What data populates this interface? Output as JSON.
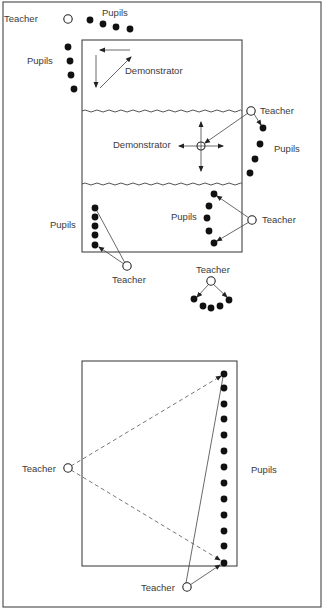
{
  "diagram1": {
    "box": {
      "x": 82,
      "y": 40,
      "w": 160,
      "h": 212
    },
    "dividers": [
      110,
      184
    ],
    "labels": [
      {
        "id": "teacher-topleft",
        "text": "Teacher",
        "x": 4,
        "y": 22
      },
      {
        "id": "pupils-top",
        "text": "Pupils",
        "x": 102,
        "y": 16
      },
      {
        "id": "pupils-left",
        "text": "Pupils",
        "x": 27,
        "y": 64
      },
      {
        "id": "demonstrator-top",
        "text": "Demonstrator",
        "x": 125,
        "y": 74
      },
      {
        "id": "teacher-mid-right",
        "text": "Teacher",
        "x": 260,
        "y": 114
      },
      {
        "id": "pupils-mid-right",
        "text": "Pupils",
        "x": 274,
        "y": 152
      },
      {
        "id": "demonstrator-mid",
        "text": "Demonstrator",
        "x": 113,
        "y": 148
      },
      {
        "id": "pupils-lower-left",
        "text": "Pupils",
        "x": 50,
        "y": 228
      },
      {
        "id": "pupils-lower-mid",
        "text": "Pupils",
        "x": 171,
        "y": 220
      },
      {
        "id": "teacher-lower-right",
        "text": "Teacher",
        "x": 262,
        "y": 223
      },
      {
        "id": "teacher-lower-left",
        "text": "Teacher",
        "x": 112,
        "y": 283
      },
      {
        "id": "teacher-bottom-group",
        "text": "Teacher",
        "x": 196,
        "y": 273
      }
    ],
    "teachers": [
      {
        "id": "t1",
        "x": 68,
        "y": 19
      },
      {
        "id": "t2",
        "x": 251,
        "y": 111
      },
      {
        "id": "t3",
        "x": 252,
        "y": 220
      },
      {
        "id": "t4",
        "x": 127,
        "y": 266
      },
      {
        "id": "t5",
        "x": 211,
        "y": 281
      }
    ],
    "pupils": [
      {
        "x": 90,
        "y": 20
      },
      {
        "x": 103,
        "y": 24
      },
      {
        "x": 116,
        "y": 27
      },
      {
        "x": 130,
        "y": 29
      },
      {
        "x": 68,
        "y": 47
      },
      {
        "x": 70,
        "y": 61
      },
      {
        "x": 71,
        "y": 75
      },
      {
        "x": 74,
        "y": 89
      },
      {
        "x": 263,
        "y": 128
      },
      {
        "x": 260,
        "y": 144
      },
      {
        "x": 255,
        "y": 159
      },
      {
        "x": 250,
        "y": 173
      },
      {
        "x": 95,
        "y": 208
      },
      {
        "x": 95,
        "y": 217
      },
      {
        "x": 95,
        "y": 226
      },
      {
        "x": 95,
        "y": 235
      },
      {
        "x": 95,
        "y": 245
      },
      {
        "x": 214,
        "y": 194
      },
      {
        "x": 209,
        "y": 206
      },
      {
        "x": 207,
        "y": 218
      },
      {
        "x": 209,
        "y": 231
      },
      {
        "x": 214,
        "y": 243
      },
      {
        "x": 194,
        "y": 299
      },
      {
        "x": 203,
        "y": 306
      },
      {
        "x": 211,
        "y": 308
      },
      {
        "x": 220,
        "y": 306
      },
      {
        "x": 229,
        "y": 300
      }
    ]
  },
  "diagram2": {
    "box": {
      "x": 82,
      "y": 361,
      "w": 155,
      "h": 205
    },
    "labels": [
      {
        "id": "teacher-left",
        "text": "Teacher",
        "x": 22,
        "y": 472
      },
      {
        "id": "pupils-right",
        "text": "Pupils",
        "x": 251,
        "y": 473
      },
      {
        "id": "teacher-bottom",
        "text": "Teacher",
        "x": 141,
        "y": 591
      }
    ],
    "teachers": [
      {
        "id": "t6",
        "x": 68,
        "y": 468
      },
      {
        "id": "t7",
        "x": 187,
        "y": 587
      }
    ],
    "pupils_x": 224,
    "pupils_y": [
      374,
      388,
      404,
      419,
      435,
      451,
      467,
      483,
      499,
      515,
      531,
      546,
      563
    ]
  },
  "colors": {
    "ink": "#111111",
    "paper": "#ffffff",
    "frame": "#555555"
  }
}
